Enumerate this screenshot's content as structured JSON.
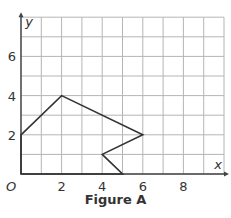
{
  "figure": {
    "caption": "Figure A",
    "x_axis_label": "x",
    "y_axis_label": "y",
    "origin_label": "O",
    "x_tick_labels": [
      "2",
      "4",
      "6",
      "8"
    ],
    "y_tick_labels": [
      "2",
      "4",
      "6"
    ],
    "grid": {
      "x_min": 0,
      "x_max": 10,
      "y_min": 0,
      "y_max": 8,
      "step": 1
    },
    "polygon_vertices": [
      [
        0,
        0
      ],
      [
        0,
        2
      ],
      [
        2,
        4
      ],
      [
        6,
        2
      ],
      [
        4,
        1
      ],
      [
        5,
        0
      ]
    ],
    "colors": {
      "grid": "#b5b5b5",
      "axis": "#444444",
      "shape": "#333333"
    }
  }
}
